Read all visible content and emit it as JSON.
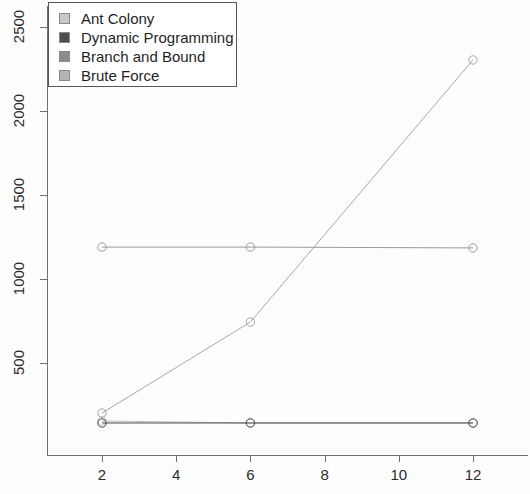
{
  "chart_data": {
    "type": "line",
    "title": "",
    "xlabel": "",
    "ylabel": "",
    "x_ticks": [
      2,
      4,
      6,
      8,
      10,
      12
    ],
    "y_ticks": [
      500,
      1000,
      1500,
      2000,
      2500
    ],
    "xlim": [
      1.1,
      13.0
    ],
    "ylim": [
      95,
      2660
    ],
    "grid": false,
    "legend_position": "top-left",
    "marker": "open-circle",
    "series": [
      {
        "name": "Ant Colony",
        "color": "#bfbfbf",
        "x": [
          2,
          6,
          12
        ],
        "values": [
          155,
          143,
          143
        ]
      },
      {
        "name": "Dynamic Programming",
        "color": "#4a4a4a",
        "x": [
          2,
          6,
          12
        ],
        "values": [
          143,
          143,
          143
        ]
      },
      {
        "name": "Branch and Bound",
        "color": "#9a9a9a",
        "x": [
          2,
          6,
          12
        ],
        "values": [
          1190,
          1190,
          1185
        ]
      },
      {
        "name": "Brute Force",
        "color": "#a8a8a8",
        "x": [
          2,
          6,
          12
        ],
        "values": [
          202,
          744,
          2304
        ]
      }
    ]
  },
  "legend": {
    "items": [
      {
        "label": "Ant Colony",
        "swatch": "#c9c9c9"
      },
      {
        "label": "Dynamic Programming",
        "swatch": "#4d4d4d"
      },
      {
        "label": "Branch and Bound",
        "swatch": "#8c8c8c"
      },
      {
        "label": "Brute Force",
        "swatch": "#b5b5b5"
      }
    ]
  },
  "axes": {
    "x_tick_labels": [
      "2",
      "4",
      "6",
      "8",
      "10",
      "12"
    ],
    "y_tick_labels": [
      "500",
      "1000",
      "1500",
      "2000",
      "2500"
    ]
  },
  "style": {
    "axis_color": "#6e6e6e",
    "text_color": "#2b2b2b",
    "background": "#fdfdfd"
  }
}
